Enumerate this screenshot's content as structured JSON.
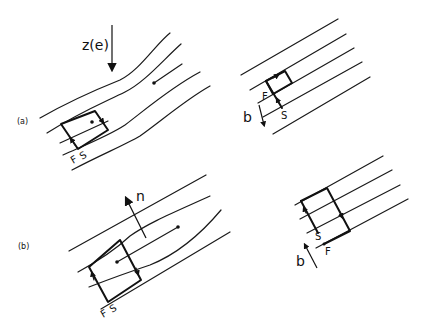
{
  "figure": {
    "panels": [
      {
        "id": "a",
        "label": "(a)"
      },
      {
        "id": "b",
        "label": "(b)"
      }
    ],
    "annotations": {
      "field_direction": "z(e)",
      "normal": "n",
      "b_vector_a": "b",
      "b_vector_b": "b",
      "a_left_F": "F",
      "a_left_S": "S",
      "a_right_F": "F",
      "a_right_S": "S",
      "b_left_F": "F",
      "b_left_S": "S",
      "b_right_S": "S",
      "b_right_F": "F"
    },
    "colors": {
      "stroke": "#111111",
      "background": "#ffffff"
    }
  }
}
